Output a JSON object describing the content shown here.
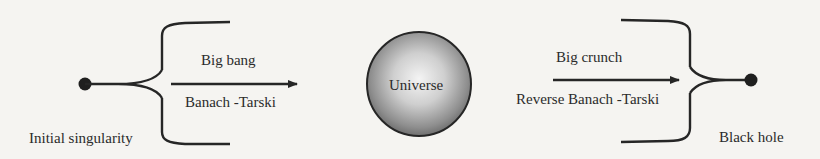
{
  "diagram": {
    "nodes": {
      "initial_singularity": {
        "label": "Initial singularity"
      },
      "universe": {
        "label": "Universe"
      },
      "black_hole": {
        "label": "Black hole"
      }
    },
    "edges": {
      "forward": {
        "from": "initial_singularity",
        "to": "universe",
        "label_top": "Big bang",
        "label_bottom": "Banach -Tarski"
      },
      "reverse": {
        "from": "universe",
        "to": "black_hole",
        "label_top": "Big crunch",
        "label_bottom": "Reverse Banach -Tarski"
      }
    },
    "colors": {
      "stroke": "#262626",
      "background": "#f5f4f1",
      "sphere_highlight": "#f2f2f2",
      "sphere_shadow": "#7a7a7a"
    }
  }
}
